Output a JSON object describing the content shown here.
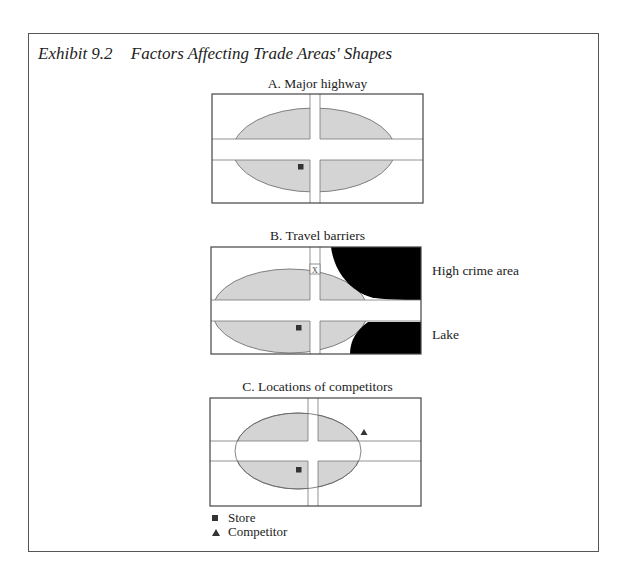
{
  "exhibit": {
    "number": "Exhibit 9.2",
    "title": "Factors Affecting Trade Areas' Shapes"
  },
  "panels": [
    {
      "id": "A",
      "title": "A. Major highway"
    },
    {
      "id": "B",
      "title": "B. Travel barriers",
      "road_marker": "X",
      "labels": {
        "high_crime": "High crime area",
        "lake": "Lake"
      }
    },
    {
      "id": "C",
      "title": "C. Locations of competitors"
    }
  ],
  "legend": [
    {
      "symbol": "square-icon",
      "label": "Store"
    },
    {
      "symbol": "triangle-icon",
      "label": "Competitor"
    }
  ],
  "colors": {
    "trade_area_fill": "#d4d4d4",
    "outline": "#555555",
    "barrier_fill": "#000000",
    "marker": "#333333"
  }
}
